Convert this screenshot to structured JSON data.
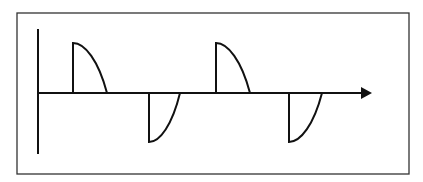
{
  "diagram": {
    "colors": {
      "stroke": "#111111",
      "frame": "#333333",
      "background": "#ffffff"
    },
    "frame": {
      "x": 17,
      "y": 13,
      "width": 392,
      "height": 161
    },
    "axes": {
      "vertical": {
        "x": 38,
        "y1": 29,
        "y2": 154
      },
      "horizontal": {
        "y": 93,
        "x1": 38,
        "x2": 362,
        "arrow_tip": 372
      }
    },
    "pulses": [
      {
        "polarity": "positive",
        "start_x": 73,
        "end_x": 107,
        "peak_y": 43
      },
      {
        "polarity": "negative",
        "start_x": 149,
        "end_x": 180,
        "peak_y": 142
      },
      {
        "polarity": "positive",
        "start_x": 216,
        "end_x": 250,
        "peak_y": 43
      },
      {
        "polarity": "negative",
        "start_x": 289,
        "end_x": 322,
        "peak_y": 142
      }
    ]
  }
}
